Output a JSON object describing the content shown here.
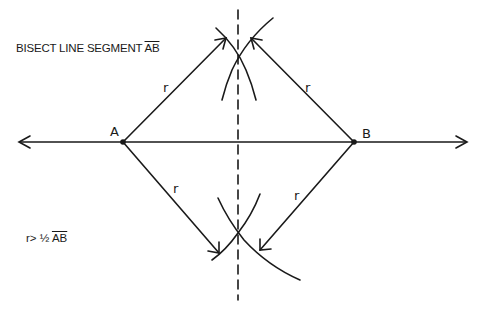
{
  "title": {
    "prefix": "BISECT LINE SEGMENT ",
    "segment": "AB"
  },
  "condition": {
    "prefix": "r> ½ ",
    "segment": "AB"
  },
  "points": {
    "A": {
      "label": "A",
      "x": 123,
      "y": 142
    },
    "B": {
      "label": "B",
      "x": 354,
      "y": 142
    }
  },
  "radius_labels": [
    "r",
    "r",
    "r",
    "r"
  ],
  "colors": {
    "ink": "#1a1a1a",
    "background": "#ffffff"
  }
}
